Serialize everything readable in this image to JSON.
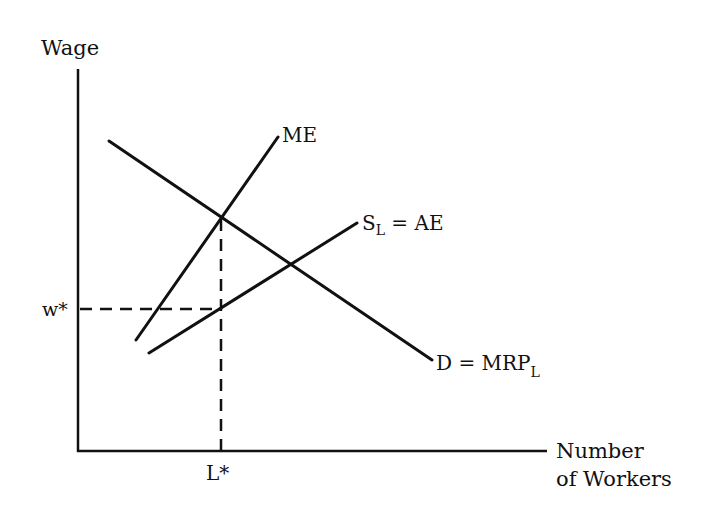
{
  "diagram": {
    "colors": {
      "line": "#111111",
      "background": "#ffffff"
    },
    "axes": {
      "y_label": "Wage",
      "x_label_line1": "Number",
      "x_label_line2": "of Workers"
    },
    "curves": {
      "me": {
        "label": "ME"
      },
      "supply": {
        "label_main": "S",
        "label_sub": "L",
        "label_rest": " = AE"
      },
      "demand": {
        "label_main": "D = MRP",
        "label_sub": "L"
      }
    },
    "markers": {
      "wage": "w*",
      "quantity": "L*"
    }
  }
}
